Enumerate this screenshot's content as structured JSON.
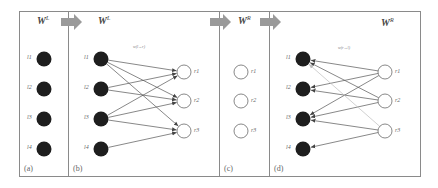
{
  "figure": {
    "frame": {
      "x": 19,
      "y": 11,
      "w": 401,
      "h": 165,
      "stroke": "#8a8a8a"
    },
    "arrow_color": "#999999",
    "node_fill_left": "#1e1e1e",
    "node_fill_right": "#ffffff",
    "edge_color": "#555555",
    "edge_color_light": "#bdbdbd",
    "panels": [
      {
        "id": "a",
        "label": "(a)",
        "title": "W",
        "title_sup": "L",
        "left_nodes": [
          "l1",
          "l2",
          "l3",
          "l4"
        ],
        "right_nodes": [],
        "edges": []
      },
      {
        "id": "b",
        "label": "(b)",
        "title": "W",
        "title_sup": "L",
        "edge_label": "w(l→r)",
        "left_nodes": [
          "l1",
          "l2",
          "l3",
          "l4"
        ],
        "right_nodes": [
          "r1",
          "r2",
          "r3"
        ],
        "edges": [
          {
            "from": "l1",
            "to": "r1"
          },
          {
            "from": "l1",
            "to": "r2"
          },
          {
            "from": "l1",
            "to": "r3"
          },
          {
            "from": "l2",
            "to": "r1"
          },
          {
            "from": "l2",
            "to": "r2"
          },
          {
            "from": "l3",
            "to": "r1"
          },
          {
            "from": "l3",
            "to": "r2"
          },
          {
            "from": "l3",
            "to": "r3"
          },
          {
            "from": "l4",
            "to": "r3"
          }
        ]
      },
      {
        "id": "c",
        "label": "(c)",
        "title": "W",
        "title_sup": "R",
        "left_nodes": [],
        "right_nodes": [
          "r1",
          "r2",
          "r3"
        ],
        "edges": []
      },
      {
        "id": "d",
        "label": "(d)",
        "title": "W",
        "title_sup": "R",
        "edge_label": "w(r→l)",
        "left_nodes": [
          "l1",
          "l2",
          "l3",
          "l4"
        ],
        "right_nodes": [
          "r1",
          "r2",
          "r3"
        ],
        "edges": [
          {
            "from": "r1",
            "to": "l1"
          },
          {
            "from": "r1",
            "to": "l2"
          },
          {
            "from": "r1",
            "to": "l3"
          },
          {
            "from": "r2",
            "to": "l1"
          },
          {
            "from": "r2",
            "to": "l2"
          },
          {
            "from": "r2",
            "to": "l3"
          },
          {
            "from": "r3",
            "to": "l1",
            "light": true
          },
          {
            "from": "r3",
            "to": "l3"
          },
          {
            "from": "r3",
            "to": "l4"
          }
        ]
      }
    ]
  }
}
